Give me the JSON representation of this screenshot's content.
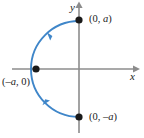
{
  "figure": {
    "type": "coordinate-plane-diagram",
    "axes": {
      "x_label": "x",
      "y_label": "y",
      "color": "#8c8c8c"
    },
    "curve": {
      "name": "semicircle-arc",
      "color": "#3f86c9",
      "stroke_width": 1.8,
      "radius": 48,
      "start": "(0, a)",
      "end": "(0, -a)",
      "direction": "left half, downward through (-a, 0)"
    },
    "points": [
      {
        "name": "point-top",
        "label_text": "(0, ",
        "label_var": "a",
        "label_tail": ")",
        "cx": 79,
        "cy": 20
      },
      {
        "name": "point-left",
        "label_text": "(–",
        "label_var": "a",
        "label_tail": ", 0)",
        "cx": 36,
        "cy": 69
      },
      {
        "name": "point-bottom",
        "label_text": "(0, –",
        "label_var": "a",
        "label_tail": ")",
        "cx": 79,
        "cy": 117
      }
    ],
    "labels": {
      "y_axis": "y",
      "x_axis": "x",
      "point_top_pre": "(0, ",
      "point_top_var": "a",
      "point_top_post": ")",
      "point_left_pre": "(–",
      "point_left_var": "a",
      "point_left_post": ", 0)",
      "point_bottom_pre": "(0, –",
      "point_bottom_var": "a",
      "point_bottom_post": ")"
    },
    "arrows": [
      {
        "name": "arrow-upper",
        "position_on_arc": "upper-left quadrant",
        "direction": "toward upper right (counterclockwise marker)"
      },
      {
        "name": "arrow-lower",
        "position_on_arc": "lower-left quadrant",
        "direction": "toward lower left"
      }
    ],
    "colors": {
      "curve": "#3f86c9",
      "axis": "#8c8c8c",
      "point": "#1a1a1a",
      "text": "#1a1a1a",
      "background": "#ffffff"
    }
  }
}
